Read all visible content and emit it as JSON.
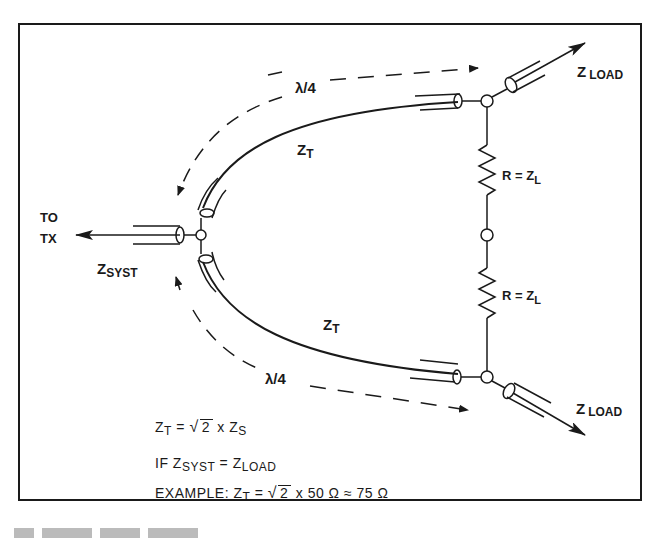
{
  "diagram": {
    "type": "quarter-wave transmission line power divider",
    "labels": {
      "lambda_top": "λ/4",
      "lambda_bottom": "λ/4",
      "zt_top": "Z",
      "zt_top_sub": "T",
      "zt_bottom": "Z",
      "zt_bottom_sub": "T",
      "to_tx_line1": "TO",
      "to_tx_line2": "TX",
      "zsyst": "Z",
      "zsyst_sub": "SYST",
      "zload_top": "Z",
      "zload_top_sub": "LOAD",
      "zload_bottom": "Z",
      "zload_bottom_sub": "LOAD",
      "resistor_top": "R = Z",
      "resistor_top_sub": "L",
      "resistor_bottom": "R = Z",
      "resistor_bottom_sub": "L"
    },
    "formulas": {
      "line1": {
        "lhs": "Z",
        "lhs_sub": "T",
        "eq": " = ",
        "radical": "2",
        "rest": " x Z",
        "rest_sub": "S"
      },
      "line2": {
        "prefix": "IF  Z",
        "sub1": "SYST",
        "mid": " = Z",
        "sub2": "LOAD"
      },
      "line3": {
        "prefix": "EXAMPLE:  Z",
        "sub": "T",
        "eq": " = ",
        "radical": "2",
        "rest": " x 50 Ω ≈ 75 Ω"
      }
    },
    "colors": {
      "ink": "#1a1a1a",
      "paper": "#ffffff"
    }
  }
}
